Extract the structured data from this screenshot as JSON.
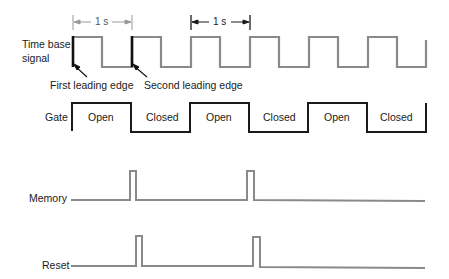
{
  "diagram": {
    "type": "timing-diagram",
    "signals": [
      {
        "name": "Time base signal",
        "label_lines": [
          "Time base",
          "signal"
        ]
      },
      {
        "name": "Gate",
        "label": "Gate",
        "phases": [
          "Open",
          "Closed",
          "Open",
          "Closed",
          "Open",
          "Closed"
        ]
      },
      {
        "name": "Memory",
        "label": "Memory"
      },
      {
        "name": "Reset",
        "label": "Reset"
      }
    ],
    "annotations": {
      "period_marker_1": "1 s",
      "period_marker_2": "1 s",
      "first_edge": "First leading edge",
      "second_edge": "Second leading edge"
    },
    "colors": {
      "wave": "#8a8a8a",
      "gate": "#1a1a1a",
      "highlight_edge": "#111111"
    }
  }
}
